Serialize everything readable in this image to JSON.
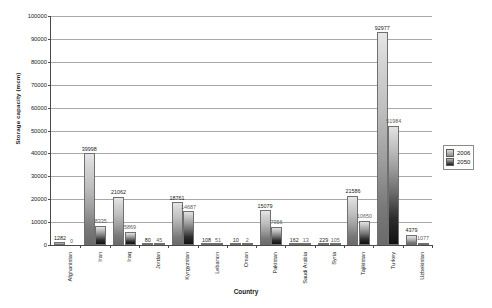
{
  "chart_data": {
    "type": "bar",
    "title": "",
    "xlabel": "Country",
    "ylabel": "Storage capacity (mcm)",
    "ylim": [
      0,
      100000
    ],
    "ytick_step": 10000,
    "yticks": [
      "0",
      "10000",
      "20000",
      "30000",
      "40000",
      "50000",
      "60000",
      "70000",
      "80000",
      "90000",
      "100000"
    ],
    "grid": true,
    "legend_position": "right",
    "categories": [
      "Afghanistan",
      "Iran",
      "Iraq",
      "Jordan",
      "Kyrgyzstan",
      "Lebanon",
      "Oman",
      "Pakistan",
      "Saudi Arabia",
      "Syria",
      "Tajikistan",
      "Turkey",
      "Uzbekistan"
    ],
    "series": [
      {
        "name": "2006",
        "values": [
          1282,
          39998,
          21062,
          80,
          18761,
          108,
          10,
          15079,
          162,
          229,
          21586,
          92977,
          4379
        ],
        "labels": [
          "1282",
          "39998",
          "21062",
          "80",
          "18761",
          "108",
          "10",
          "15079",
          "162",
          "229",
          "21586",
          "92977",
          "4379"
        ]
      },
      {
        "name": "2050",
        "values": [
          0,
          8335,
          5869,
          45,
          14687,
          51,
          2,
          7956,
          13,
          105,
          10650,
          51984,
          1077
        ],
        "labels": [
          "0",
          "8335",
          "5869",
          "45",
          "14687",
          "51",
          "2",
          "7956",
          "13",
          "105",
          "10650",
          "51984",
          "1077"
        ]
      }
    ]
  },
  "legend": {
    "entries": [
      {
        "label": "2006"
      },
      {
        "label": "2050"
      }
    ]
  },
  "colors": {
    "series_2006": "#9b9b9b",
    "series_2050": "#1a1a1a",
    "axis": "#4a4a4a",
    "grid": "#a8a8a8",
    "background": "#ffffff"
  }
}
